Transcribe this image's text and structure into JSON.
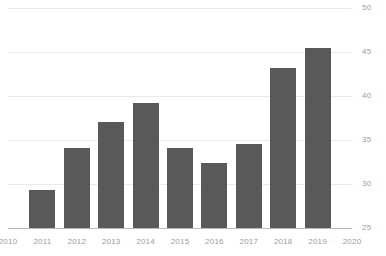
{
  "chart_data": {
    "type": "bar",
    "title": "",
    "subtitle": "",
    "xlabel": "",
    "ylabel": "",
    "categories": [
      "2011",
      "2012",
      "2013",
      "2014",
      "2015",
      "2016",
      "2017",
      "2018",
      "2019"
    ],
    "values": [
      29.3,
      34.1,
      37.1,
      39.2,
      34.1,
      32.4,
      34.6,
      43.2,
      45.5
    ],
    "series": [
      {
        "name": "",
        "values": [
          29.3,
          34.1,
          37.1,
          39.2,
          34.1,
          32.4,
          34.6,
          43.2,
          45.5
        ]
      }
    ],
    "ylim": [
      25,
      50
    ],
    "xlim": [
      "2010",
      "2020"
    ],
    "y_ticks": [
      25,
      30,
      35,
      40,
      45,
      50
    ],
    "y_tick_labels": [
      "25",
      "30",
      "35",
      "40",
      "45",
      "50"
    ],
    "x_ticks": [
      "2010",
      "2011",
      "2012",
      "2013",
      "2014",
      "2015",
      "2016",
      "2017",
      "2018",
      "2019",
      "2020"
    ],
    "x_tick_labels": [
      "2010",
      "2011",
      "2012",
      "2013",
      "2014",
      "2015",
      "2016",
      "2017",
      "2018",
      "2019",
      "2020"
    ],
    "grid": true,
    "grid_axis": "y",
    "legend": false,
    "legend_position": "none",
    "annotations": [],
    "colors": {
      "bar": "#595959",
      "gridline": "#e9e9ec",
      "axis": "#b9b9bd",
      "tick_text": "#9a9a9e",
      "background": "#ffffff"
    }
  }
}
